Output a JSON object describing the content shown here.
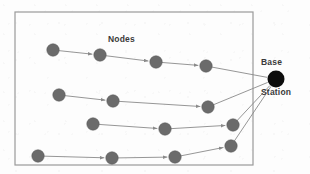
{
  "figure": {
    "type": "network-topology-diagram",
    "labels": {
      "nodes": "Nodes",
      "base_station_line1": "Base",
      "base_station_line2": "Station"
    },
    "colors": {
      "background": "#fdfdfd",
      "border": "#9a9a9a",
      "node_fill": "#6b6b6b",
      "node_stroke": "#5a5a5a",
      "base_station_fill": "#0d0d0d",
      "link": "#8a8a8a",
      "text": "#3a3a3a"
    },
    "field_rect": {
      "x": 15,
      "y": 12,
      "width": 238,
      "height": 153,
      "stroke_width": 1.2
    },
    "base_station": {
      "name": "base-station",
      "cx": 276,
      "cy": 79,
      "r": 8.5
    },
    "node_radius": 6.2,
    "chains": [
      {
        "name": "chain-1",
        "nodes": [
          {
            "id": "n1-1",
            "cx": 53,
            "cy": 50
          },
          {
            "id": "n1-2",
            "cx": 100,
            "cy": 55
          },
          {
            "id": "n1-3",
            "cx": 156,
            "cy": 62
          },
          {
            "id": "n1-4",
            "cx": 206,
            "cy": 66
          }
        ]
      },
      {
        "name": "chain-2",
        "nodes": [
          {
            "id": "n2-1",
            "cx": 59,
            "cy": 95
          },
          {
            "id": "n2-2",
            "cx": 113,
            "cy": 101
          },
          {
            "id": "n2-3",
            "cx": 208,
            "cy": 107
          }
        ]
      },
      {
        "name": "chain-3",
        "nodes": [
          {
            "id": "n3-1",
            "cx": 93,
            "cy": 124
          },
          {
            "id": "n3-2",
            "cx": 165,
            "cy": 129
          },
          {
            "id": "n3-3",
            "cx": 233,
            "cy": 125
          }
        ]
      },
      {
        "name": "chain-4",
        "nodes": [
          {
            "id": "n4-1",
            "cx": 38,
            "cy": 156
          },
          {
            "id": "n4-2",
            "cx": 112,
            "cy": 158
          },
          {
            "id": "n4-3",
            "cx": 175,
            "cy": 157
          },
          {
            "id": "n4-4",
            "cx": 231,
            "cy": 146
          }
        ]
      }
    ],
    "uplinks": [
      {
        "name": "uplink-chain-1",
        "from": "n1-4"
      },
      {
        "name": "uplink-chain-2",
        "from": "n2-3"
      },
      {
        "name": "uplink-chain-3",
        "from": "n3-3"
      },
      {
        "name": "uplink-chain-4",
        "from": "n4-4"
      }
    ]
  }
}
